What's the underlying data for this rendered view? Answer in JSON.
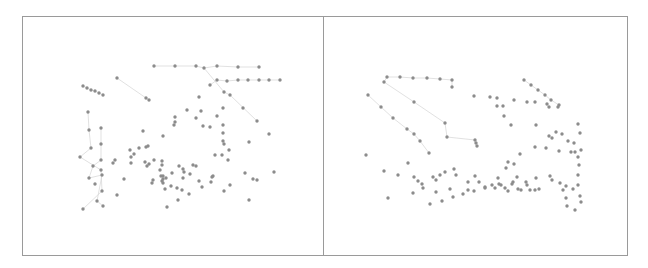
{
  "figure": {
    "title": "",
    "panels": [
      {
        "id": "left",
        "frame": {
          "x": 22,
          "y": 16,
          "w": 301,
          "h": 239
        },
        "nodes": [
          [
            154,
            66
          ],
          [
            175,
            66
          ],
          [
            196,
            66
          ],
          [
            204,
            68
          ],
          [
            217,
            66
          ],
          [
            238,
            67
          ],
          [
            259,
            67
          ],
          [
            210,
            85
          ],
          [
            217,
            80
          ],
          [
            227,
            81
          ],
          [
            238,
            80
          ],
          [
            248,
            80
          ],
          [
            259,
            80
          ],
          [
            269,
            80
          ],
          [
            280,
            80
          ],
          [
            83,
            86
          ],
          [
            87,
            88
          ],
          [
            91,
            90
          ],
          [
            95,
            91
          ],
          [
            99,
            93
          ],
          [
            103,
            95
          ],
          [
            117,
            78
          ],
          [
            146,
            98
          ],
          [
            149,
            100
          ],
          [
            224,
            92
          ],
          [
            230,
            95
          ],
          [
            199,
            97
          ],
          [
            187,
            110
          ],
          [
            88,
            112
          ],
          [
            89,
            130
          ],
          [
            101,
            128
          ],
          [
            91,
            148
          ],
          [
            101,
            144
          ],
          [
            80,
            157
          ],
          [
            101,
            160
          ],
          [
            93,
            166
          ],
          [
            101,
            170
          ],
          [
            89,
            178
          ],
          [
            95,
            184
          ],
          [
            102,
            175
          ],
          [
            102,
            191
          ],
          [
            97,
            201
          ],
          [
            83,
            209
          ],
          [
            103,
            206
          ],
          [
            143,
            131
          ],
          [
            139,
            148
          ],
          [
            146,
            147
          ],
          [
            145,
            162
          ],
          [
            163,
            136
          ],
          [
            174,
            125
          ],
          [
            175,
            117
          ],
          [
            175,
            122
          ],
          [
            201,
            111
          ],
          [
            196,
            118
          ],
          [
            203,
            126
          ],
          [
            210,
            127
          ],
          [
            217,
            116
          ],
          [
            223,
            108
          ],
          [
            223,
            125
          ],
          [
            223,
            133
          ],
          [
            223,
            141
          ],
          [
            224,
            144
          ],
          [
            243,
            108
          ],
          [
            257,
            121
          ],
          [
            269,
            134
          ],
          [
            163,
            176
          ],
          [
            166,
            178
          ],
          [
            149,
            164
          ],
          [
            147,
            166
          ],
          [
            154,
            160
          ],
          [
            162,
            161
          ],
          [
            153,
            180
          ],
          [
            152,
            183
          ],
          [
            113,
            163
          ],
          [
            115,
            160
          ],
          [
            131,
            163
          ],
          [
            130,
            150
          ],
          [
            131,
            157
          ],
          [
            148,
            146
          ],
          [
            134,
            154
          ],
          [
            162,
            165
          ],
          [
            160,
            170
          ],
          [
            161,
            176
          ],
          [
            163,
            179
          ],
          [
            163,
            183
          ],
          [
            162,
            181
          ],
          [
            165,
            189
          ],
          [
            171,
            186
          ],
          [
            177,
            188
          ],
          [
            182,
            190
          ],
          [
            172,
            173
          ],
          [
            179,
            166
          ],
          [
            183,
            169
          ],
          [
            183,
            178
          ],
          [
            184,
            172
          ],
          [
            193,
            165
          ],
          [
            190,
            174
          ],
          [
            196,
            166
          ],
          [
            189,
            194
          ],
          [
            178,
            200
          ],
          [
            167,
            207
          ],
          [
            199,
            181
          ],
          [
            202,
            187
          ],
          [
            211,
            182
          ],
          [
            212,
            177
          ],
          [
            213,
            176
          ],
          [
            215,
            155
          ],
          [
            222,
            155
          ],
          [
            229,
            150
          ],
          [
            249,
            142
          ],
          [
            228,
            160
          ],
          [
            224,
            191
          ],
          [
            249,
            200
          ],
          [
            230,
            185
          ],
          [
            245,
            173
          ],
          [
            253,
            179
          ],
          [
            257,
            180
          ],
          [
            274,
            172
          ],
          [
            117,
            195
          ],
          [
            124,
            179
          ]
        ],
        "edges": [
          [
            0,
            1
          ],
          [
            1,
            2
          ],
          [
            2,
            3
          ],
          [
            3,
            4
          ],
          [
            4,
            5
          ],
          [
            5,
            6
          ],
          [
            7,
            8
          ],
          [
            8,
            9
          ],
          [
            9,
            10
          ],
          [
            10,
            11
          ],
          [
            11,
            12
          ],
          [
            12,
            13
          ],
          [
            13,
            14
          ],
          [
            15,
            16
          ],
          [
            16,
            17
          ],
          [
            17,
            18
          ],
          [
            18,
            19
          ],
          [
            19,
            20
          ],
          [
            21,
            22
          ],
          [
            22,
            23
          ],
          [
            3,
            24
          ],
          [
            24,
            25
          ],
          [
            25,
            63
          ],
          [
            28,
            29
          ],
          [
            29,
            31
          ],
          [
            31,
            33
          ],
          [
            33,
            36
          ],
          [
            36,
            40
          ],
          [
            40,
            42
          ],
          [
            30,
            32
          ],
          [
            32,
            34
          ],
          [
            34,
            35
          ],
          [
            35,
            37
          ],
          [
            37,
            39
          ],
          [
            39,
            41
          ],
          [
            41,
            43
          ]
        ]
      },
      {
        "id": "right",
        "frame": {
          "x": 323,
          "y": 16,
          "w": 304,
          "h": 239
        },
        "nodes": [
          [
            387,
            77
          ],
          [
            384,
            82
          ],
          [
            400,
            77
          ],
          [
            413,
            78
          ],
          [
            427,
            78
          ],
          [
            440,
            79
          ],
          [
            452,
            80
          ],
          [
            452,
            87
          ],
          [
            368,
            95
          ],
          [
            381,
            107
          ],
          [
            393,
            118
          ],
          [
            407,
            129
          ],
          [
            414,
            134
          ],
          [
            420,
            141
          ],
          [
            429,
            153
          ],
          [
            414,
            102
          ],
          [
            445,
            123
          ],
          [
            447,
            137
          ],
          [
            475,
            140
          ],
          [
            476,
            143
          ],
          [
            477,
            146
          ],
          [
            474,
            96
          ],
          [
            490,
            97
          ],
          [
            497,
            98
          ],
          [
            497,
            106
          ],
          [
            503,
            106
          ],
          [
            514,
            100
          ],
          [
            527,
            102
          ],
          [
            535,
            102
          ],
          [
            547,
            104
          ],
          [
            549,
            107
          ],
          [
            558,
            107
          ],
          [
            524,
            80
          ],
          [
            531,
            85
          ],
          [
            538,
            90
          ],
          [
            545,
            95
          ],
          [
            551,
            100
          ],
          [
            559,
            105
          ],
          [
            504,
            116
          ],
          [
            511,
            125
          ],
          [
            536,
            125
          ],
          [
            562,
            134
          ],
          [
            568,
            141
          ],
          [
            575,
            152
          ],
          [
            571,
            152
          ],
          [
            578,
            157
          ],
          [
            580,
            133
          ],
          [
            578,
            124
          ],
          [
            559,
            151
          ],
          [
            366,
            155
          ],
          [
            408,
            163
          ],
          [
            418,
            181
          ],
          [
            422,
            184
          ],
          [
            445,
            172
          ],
          [
            456,
            175
          ],
          [
            454,
            169
          ],
          [
            475,
            176
          ],
          [
            384,
            171
          ],
          [
            398,
            175
          ],
          [
            414,
            177
          ],
          [
            433,
            177
          ],
          [
            436,
            180
          ],
          [
            440,
            175
          ],
          [
            468,
            182
          ],
          [
            479,
            182
          ],
          [
            492,
            185
          ],
          [
            495,
            188
          ],
          [
            498,
            178
          ],
          [
            499,
            184
          ],
          [
            505,
            188
          ],
          [
            518,
            189
          ],
          [
            521,
            190
          ],
          [
            513,
            182
          ],
          [
            526,
            182
          ],
          [
            517,
            177
          ],
          [
            527,
            185
          ],
          [
            530,
            190
          ],
          [
            535,
            190
          ],
          [
            539,
            189
          ],
          [
            506,
            168
          ],
          [
            508,
            162
          ],
          [
            514,
            164
          ],
          [
            520,
            154
          ],
          [
            535,
            147
          ],
          [
            546,
            148
          ],
          [
            549,
            136
          ],
          [
            552,
            138
          ],
          [
            556,
            132
          ],
          [
            388,
            198
          ],
          [
            413,
            193
          ],
          [
            423,
            188
          ],
          [
            436,
            192
          ],
          [
            450,
            189
          ],
          [
            468,
            190
          ],
          [
            485,
            188
          ],
          [
            501,
            185
          ],
          [
            430,
            204
          ],
          [
            442,
            201
          ],
          [
            453,
            197
          ],
          [
            463,
            194
          ],
          [
            474,
            191
          ],
          [
            485,
            187
          ],
          [
            508,
            191
          ],
          [
            512,
            184
          ],
          [
            536,
            178
          ],
          [
            550,
            176
          ],
          [
            552,
            180
          ],
          [
            560,
            183
          ],
          [
            566,
            186
          ],
          [
            563,
            190
          ],
          [
            573,
            189
          ],
          [
            578,
            185
          ],
          [
            578,
            175
          ],
          [
            579,
            165
          ],
          [
            581,
            150
          ],
          [
            574,
            143
          ],
          [
            566,
            198
          ],
          [
            567,
            206
          ],
          [
            575,
            210
          ],
          [
            580,
            196
          ],
          [
            581,
            202
          ]
        ],
        "edges": [
          [
            0,
            1
          ],
          [
            0,
            2
          ],
          [
            2,
            3
          ],
          [
            3,
            4
          ],
          [
            4,
            5
          ],
          [
            5,
            6
          ],
          [
            6,
            7
          ],
          [
            8,
            9
          ],
          [
            9,
            10
          ],
          [
            10,
            11
          ],
          [
            11,
            12
          ],
          [
            12,
            13
          ],
          [
            13,
            14
          ],
          [
            1,
            15
          ],
          [
            15,
            16
          ],
          [
            16,
            17
          ],
          [
            17,
            18
          ],
          [
            32,
            33
          ],
          [
            33,
            34
          ],
          [
            34,
            35
          ],
          [
            35,
            36
          ],
          [
            36,
            37
          ]
        ]
      }
    ]
  }
}
